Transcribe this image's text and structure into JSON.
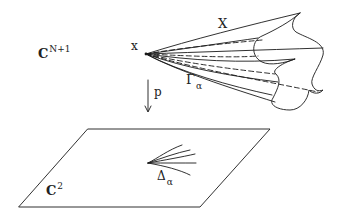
{
  "diagram": {
    "labels": {
      "ambient_space": {
        "base": "C",
        "superscript": "N+1"
      },
      "point": "x",
      "variety": "X",
      "projection": "p",
      "cone_branch": {
        "base": "Γ",
        "subscript": "α"
      },
      "plane": {
        "base": "C",
        "superscript": "2"
      },
      "image_branch": {
        "base": "Δ",
        "subscript": "α"
      }
    },
    "colors": {
      "stroke": "#1a1a1a",
      "background": "#ffffff"
    },
    "elements": [
      "cone surface X with apex at point x, with dashed hidden lines",
      "wavy boundary curve on the right of the cone",
      "downward arrow labeled p (projection)",
      "parallelogram plane C^2",
      "fan of branch curves Δ_α in the plane"
    ]
  }
}
